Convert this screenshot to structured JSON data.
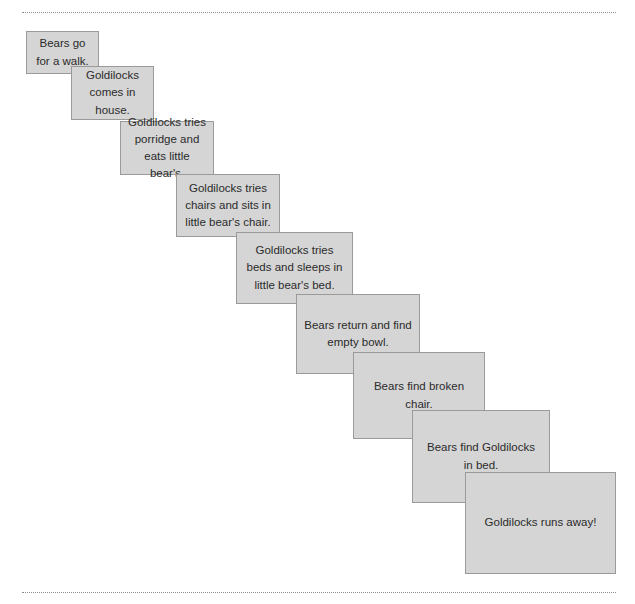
{
  "document": {
    "title": "Goldilocks Story Sequence Cards",
    "top_rule": "dotted-divider",
    "bottom_rule": "dotted-divider"
  },
  "style": {
    "card_fill": "#d5d5d5",
    "card_border": "#9a9a9a",
    "text_color": "#2b2b2b",
    "rule_color": "#8c8c8c",
    "background": "#ffffff"
  },
  "cards": [
    {
      "index": 1,
      "text": "Bears go\nfor a walk.",
      "x": 26,
      "y": 31,
      "w": 73,
      "h": 43
    },
    {
      "index": 2,
      "text": "Goldilocks\ncomes in\nhouse.",
      "x": 71,
      "y": 66,
      "w": 83,
      "h": 54
    },
    {
      "index": 3,
      "text": "Goldilocks tries\nporridge and\neats little bear's.",
      "x": 120,
      "y": 121,
      "w": 94,
      "h": 54
    },
    {
      "index": 4,
      "text": "Goldilocks tries\nchairs and sits in\nlittle bear's chair.",
      "x": 176,
      "y": 174,
      "w": 104,
      "h": 63
    },
    {
      "index": 5,
      "text": "Goldilocks tries\nbeds and sleeps in\nlittle bear's bed.",
      "x": 236,
      "y": 232,
      "w": 117,
      "h": 72
    },
    {
      "index": 6,
      "text": "Bears return and find\nempty bowl.",
      "x": 296,
      "y": 294,
      "w": 124,
      "h": 80
    },
    {
      "index": 7,
      "text": "Bears find broken chair.",
      "x": 353,
      "y": 352,
      "w": 132,
      "h": 87
    },
    {
      "index": 8,
      "text": "Bears find Goldilocks\nin bed.",
      "x": 412,
      "y": 410,
      "w": 138,
      "h": 93
    },
    {
      "index": 9,
      "text": "Goldilocks runs away!",
      "x": 465,
      "y": 472,
      "w": 151,
      "h": 102
    }
  ]
}
